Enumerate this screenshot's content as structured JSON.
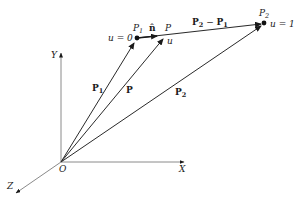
{
  "diagram": {
    "type": "vector-line-parametric",
    "axes": {
      "x_label": "X",
      "y_label": "Y",
      "z_label": "Z",
      "origin_label": "O"
    },
    "points": {
      "p1": {
        "name": "P",
        "sub": "1",
        "param": "u = 0"
      },
      "p": {
        "name": "P",
        "param": "u"
      },
      "p2": {
        "name": "P",
        "sub": "2",
        "param": "u = 1"
      }
    },
    "vectors": {
      "p1_vec": {
        "name": "P",
        "sub": "1"
      },
      "p_vec": {
        "name": "P"
      },
      "p2_vec": {
        "name": "P",
        "sub": "2"
      },
      "unit_n": {
        "name": "n̂"
      },
      "diff": {
        "a": "P",
        "a_sub": "2",
        "op": " − ",
        "b": "P",
        "b_sub": "1"
      }
    },
    "colors": {
      "line": "#2a2a2a",
      "axis": "#7a7a7a",
      "text": "#1a1a1a"
    }
  }
}
